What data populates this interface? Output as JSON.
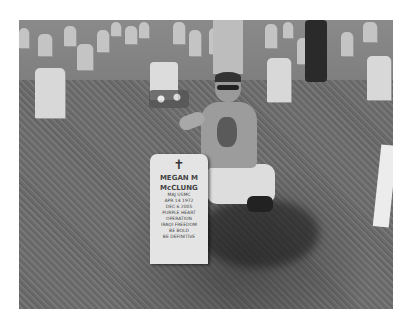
{
  "image": {
    "description": "Grayscale photo of a man kneeling beside a white military headstone in a cemetery with rows of headstones on grass",
    "headstone": {
      "symbol": "cross",
      "name_line1": "MEGAN M",
      "name_line2": "McCLUNG",
      "inscription": [
        "MAJ USMC",
        "APR 14 1972",
        "DEC 6 2005",
        "PURPLE HEART",
        "OPERATION",
        "IRAQI FREEDOM",
        "BE BOLD",
        "BE DEFINITIVE"
      ]
    }
  }
}
